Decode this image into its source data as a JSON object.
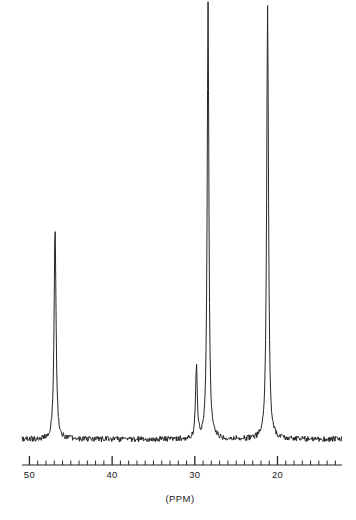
{
  "figure": {
    "name": "carbon-13-nmr-spectrum",
    "background_color": "#ffffff",
    "trace_color": "#262626",
    "axis_color": "#262626"
  },
  "axis": {
    "title": "(PPM)",
    "tick_labels": [
      "50",
      "40",
      "30",
      "20"
    ],
    "tick_values": [
      50,
      40,
      30,
      20
    ],
    "minor_tick_step": 1,
    "direction": "decreasing-left-to-right",
    "range_left_ppm": 50.9,
    "range_right_ppm": 12.2
  },
  "chart_data": {
    "type": "line",
    "title": "",
    "subtitle": "",
    "xlabel": "(PPM)",
    "ylabel": "",
    "grid": false,
    "legend": "none",
    "x_axis_inverted": true,
    "xlim": [
      50.9,
      12.2
    ],
    "ylim": [
      0,
      100
    ],
    "x_tick_labels": [
      "50",
      "40",
      "30",
      "20"
    ],
    "x_ticks_major": [
      50,
      40,
      30,
      20
    ],
    "x_ticks_minor_step": 1,
    "baseline_level": 2,
    "peaks": [
      {
        "label": "peak-1",
        "ppm": 46.9,
        "intensity": 49,
        "width_ppm": 0.3
      },
      {
        "label": "peak-2",
        "ppm": 29.8,
        "intensity": 17,
        "width_ppm": 0.26
      },
      {
        "label": "peak-3",
        "ppm": 28.4,
        "intensity": 100,
        "width_ppm": 0.26
      },
      {
        "label": "peak-4",
        "ppm": 21.2,
        "intensity": 100,
        "width_ppm": 0.28
      }
    ],
    "series": [
      {
        "name": "13C NMR trace",
        "x": [
          50.9,
          46.9,
          29.8,
          28.4,
          21.2,
          12.2
        ],
        "values": [
          2,
          49,
          17,
          100,
          100,
          2
        ]
      }
    ]
  }
}
